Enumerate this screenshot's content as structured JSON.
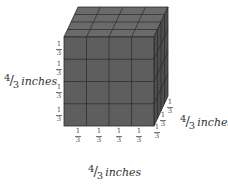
{
  "figure": {
    "type": "cube-volume-diagram",
    "grid_divisions": 4,
    "unit_cube_edge": "1/3",
    "colors": {
      "front_face": "#5e5e5e",
      "top_face": "#6a6a6a",
      "right_face": "#4e4e4e",
      "grid_lines": "#2a2a2a"
    }
  },
  "labels": {
    "height": {
      "numerator": "4",
      "denominator": "3",
      "unit": "inches"
    },
    "width": {
      "numerator": "4",
      "denominator": "3",
      "unit": "inches"
    },
    "depth": {
      "numerator": "4",
      "denominator": "3",
      "unit": "inches"
    }
  },
  "segment_labels": {
    "height": [
      {
        "numerator": "1",
        "denominator": "3"
      },
      {
        "numerator": "1",
        "denominator": "3"
      },
      {
        "numerator": "1",
        "denominator": "3"
      },
      {
        "numerator": "1",
        "denominator": "3"
      }
    ],
    "width": [
      {
        "numerator": "1",
        "denominator": "3"
      },
      {
        "numerator": "1",
        "denominator": "3"
      },
      {
        "numerator": "1",
        "denominator": "3"
      },
      {
        "numerator": "1",
        "denominator": "3"
      }
    ],
    "depth": [
      {
        "numerator": "1",
        "denominator": "3"
      },
      {
        "numerator": "1",
        "denominator": "3"
      },
      {
        "numerator": "1",
        "denominator": "3"
      }
    ]
  }
}
